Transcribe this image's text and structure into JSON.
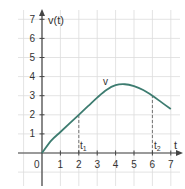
{
  "chart_data": {
    "type": "line",
    "title": "",
    "xlabel": "t",
    "ylabel": "v(t)",
    "xlim": [
      0,
      7
    ],
    "ylim": [
      0,
      7
    ],
    "x_ticks": [
      "0",
      "1",
      "2",
      "3",
      "4",
      "5",
      "6",
      "7"
    ],
    "y_ticks": [
      "1",
      "2",
      "3",
      "4",
      "5",
      "6",
      "7"
    ],
    "grid": true,
    "series": [
      {
        "name": "v",
        "x": [
          0,
          0.5,
          1,
          1.5,
          2,
          2.5,
          3,
          3.5,
          4,
          4.5,
          5,
          5.5,
          6,
          6.5,
          7
        ],
        "values": [
          0,
          0.65,
          1.1,
          1.55,
          2.0,
          2.45,
          2.9,
          3.3,
          3.55,
          3.6,
          3.5,
          3.3,
          3.0,
          2.65,
          2.3
        ]
      }
    ],
    "annotations": [
      {
        "label": "v",
        "x": 3.5,
        "y": 3.6
      },
      {
        "label": "t1",
        "x": 2,
        "dashed_line_to_y": 2.0
      },
      {
        "label": "t2",
        "x": 6,
        "dashed_line_to_y": 3.0
      }
    ],
    "colors": {
      "curve": "#3d7c70",
      "axis": "#444444",
      "grid": "#dcdcdc",
      "dashed": "#666666"
    }
  },
  "labels": {
    "origin": "0",
    "x_axis": "t",
    "y_axis": "v(t)",
    "curve": "v",
    "t1": "t",
    "t1_sub": "1",
    "t2": "t",
    "t2_sub": "2"
  }
}
